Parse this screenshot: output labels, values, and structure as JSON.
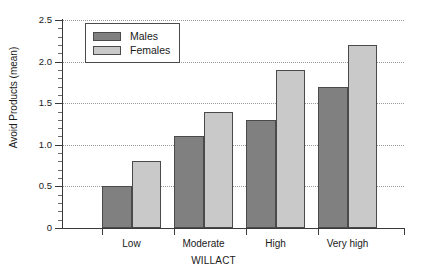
{
  "chart_data": {
    "type": "bar",
    "title": "",
    "subtitle": "",
    "xlabel": "WILLACT",
    "ylabel": "Avoid Products (mean)",
    "categories": [
      "Low",
      "Moderate",
      "High",
      "Very high"
    ],
    "series": [
      {
        "name": "Males",
        "color": "#808080",
        "values": [
          0.5,
          1.1,
          1.3,
          1.7
        ]
      },
      {
        "name": "Females",
        "color": "#c9c9c9",
        "values": [
          0.8,
          1.4,
          1.9,
          2.2
        ]
      }
    ],
    "ylim": [
      0,
      2.5
    ],
    "ytick_labels": [
      "0",
      "0.5",
      "1.0",
      "1.5",
      "2.0",
      "2.5"
    ],
    "ytick_values": [
      0,
      0.5,
      1.0,
      1.5,
      2.0,
      2.5
    ],
    "yminor_step": 0.1,
    "grid": "horizontal-dotted",
    "legend_position": "top-left-inside",
    "legend_entries": [
      "Males",
      "Females"
    ]
  }
}
